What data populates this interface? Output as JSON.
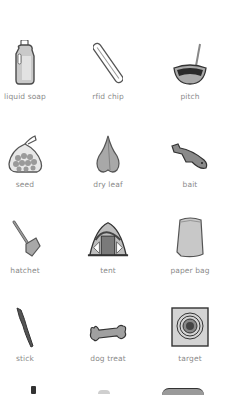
{
  "items": [
    {
      "label": "liquid soap",
      "icon": "liquid-soap-icon"
    },
    {
      "label": "rfid chip",
      "icon": "rfid-chip-icon"
    },
    {
      "label": "pitch",
      "icon": "pitch-icon"
    },
    {
      "label": "seed",
      "icon": "seed-bag-icon"
    },
    {
      "label": "dry leaf",
      "icon": "dry-leaf-icon"
    },
    {
      "label": "bait",
      "icon": "bait-fish-icon"
    },
    {
      "label": "hatchet",
      "icon": "hatchet-icon"
    },
    {
      "label": "tent",
      "icon": "tent-icon"
    },
    {
      "label": "paper bag",
      "icon": "paper-bag-icon"
    },
    {
      "label": "stick",
      "icon": "stick-icon"
    },
    {
      "label": "dog treat",
      "icon": "dog-treat-icon"
    },
    {
      "label": "target",
      "icon": "target-icon"
    }
  ]
}
